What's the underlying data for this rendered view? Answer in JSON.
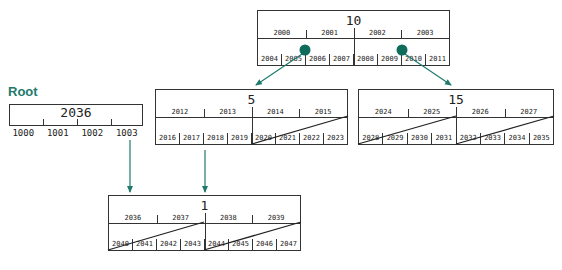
{
  "diagram": {
    "root_label": "Root",
    "root": {
      "value": "2036",
      "pointers": [
        "1000",
        "1001",
        "1002",
        "1003"
      ]
    },
    "nodes": [
      {
        "id": "node-10",
        "title": "10",
        "keys": [
          "2000",
          "2001",
          "2002",
          "2003"
        ],
        "leaves": [
          "2004",
          "2005",
          "2006",
          "2007",
          "2008",
          "2009",
          "2010",
          "2011"
        ]
      },
      {
        "id": "node-5",
        "title": "5",
        "keys": [
          "2012",
          "2013",
          "2014",
          "2015"
        ],
        "leaves": [
          "2016",
          "2017",
          "2018",
          "2019",
          "2020",
          "2021",
          "2022",
          "2023"
        ]
      },
      {
        "id": "node-15",
        "title": "15",
        "keys": [
          "2024",
          "2025",
          "2026",
          "2027"
        ],
        "leaves": [
          "2028",
          "2029",
          "2030",
          "2031",
          "2032",
          "2033",
          "2034",
          "2035"
        ]
      },
      {
        "id": "node-1",
        "title": "1",
        "keys": [
          "2036",
          "2037",
          "2038",
          "2039"
        ],
        "leaves": [
          "2040",
          "2041",
          "2042",
          "2043",
          "2044",
          "2045",
          "2046",
          "2047"
        ]
      }
    ],
    "colors": {
      "accent": "#1f7a6c",
      "line": "#333333",
      "marker": "#0f6b5a"
    }
  }
}
